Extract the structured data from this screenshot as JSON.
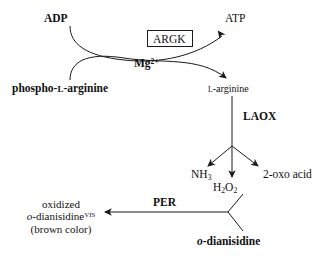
{
  "diagram": {
    "background_color": "#ffffff",
    "line_color": "#1a1a1a",
    "text_color": "#111111"
  },
  "nodes": {
    "adp": "ADP",
    "atp": "ATP",
    "phospho_l_arginine_prefix": "phospho-",
    "phospho_l_arginine_smallcap": "L",
    "phospho_l_arginine_suffix": "-arginine",
    "l_arginine_smallcap": "L",
    "l_arginine_suffix": "-arginine",
    "ammonia_formula": "NH",
    "ammonia_sub": "3",
    "hydrogen_peroxide_h": "H",
    "hydrogen_peroxide_sub1": "2",
    "hydrogen_peroxide_o": "O",
    "hydrogen_peroxide_sub2": "2",
    "oxo_acid": "2-oxo acid",
    "o_dianisidine_italic": "o",
    "o_dianisidine_rest": "-dianisidine",
    "product_line1": "oxidized",
    "product_italic_o": "o",
    "product_rest": "-dianisidine",
    "product_superscript": "VIS",
    "product_line3": "(brown color)"
  },
  "enzymes": {
    "argk": "ARGK",
    "laox": "LAOX",
    "per": "PER"
  },
  "cofactors": {
    "magnesium_symbol": "Mg",
    "magnesium_charge": "2+"
  }
}
